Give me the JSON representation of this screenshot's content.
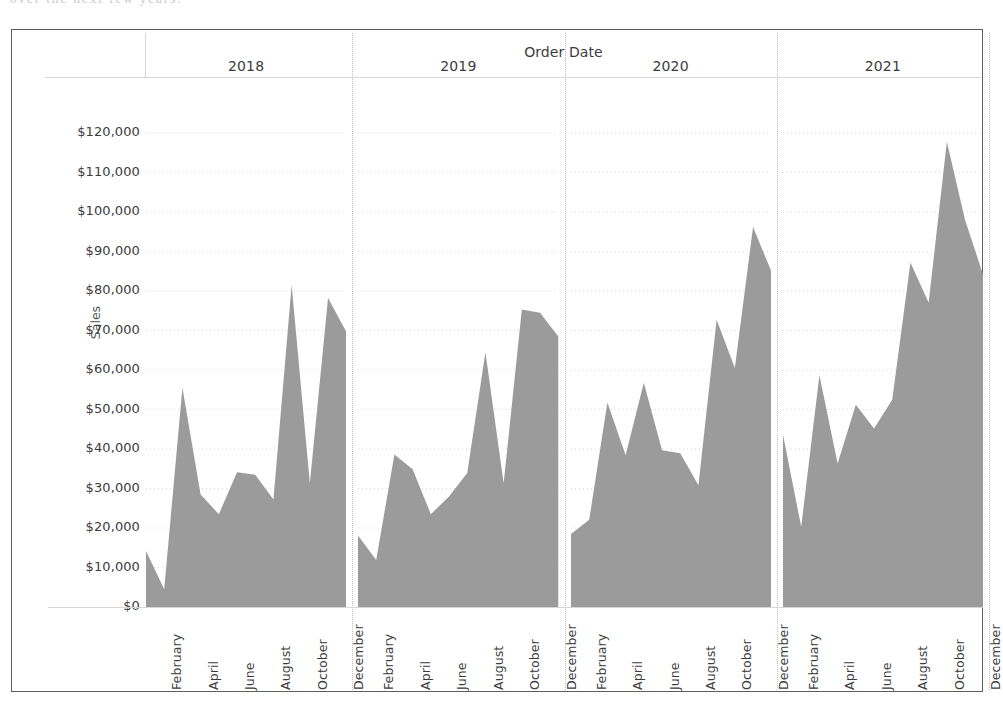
{
  "figure": {
    "title": "Order Date",
    "y_axis_title": "Sales",
    "area_color": "#9b9b9b",
    "grid_color": "#d6d6d6",
    "divider_color": "#bdbdbd",
    "frame_color": "#5d5d5d"
  },
  "scan_artifact_text": "over the next few years.",
  "y_ticks": [
    "$120,000",
    "$110,000",
    "$100,000",
    "$90,000",
    "$80,000",
    "$70,000",
    "$60,000",
    "$50,000",
    "$40,000",
    "$30,000",
    "$20,000",
    "$10,000",
    "$0"
  ],
  "panels": [
    {
      "year": "2018"
    },
    {
      "year": "2019"
    },
    {
      "year": "2020"
    },
    {
      "year": "2021"
    }
  ],
  "month_labels": [
    "February",
    "April",
    "June",
    "August",
    "October",
    "December"
  ],
  "chart_data": {
    "type": "area",
    "title": "Order Date",
    "xlabel": "Order Date",
    "ylabel": "Sales",
    "ylim": [
      0,
      120000
    ],
    "ytick_step": 10000,
    "grid": true,
    "legend": false,
    "panel_field": "Year of Order Date",
    "x_field": "Month of Order Date",
    "value_field": "Sales",
    "value_prefix": "$",
    "visible_x_tick_labels": [
      "February",
      "April",
      "June",
      "August",
      "October",
      "December"
    ],
    "months": [
      "January",
      "February",
      "March",
      "April",
      "May",
      "June",
      "July",
      "August",
      "September",
      "October",
      "November",
      "December"
    ],
    "series": [
      {
        "name": "2018",
        "values": [
          14200,
          4500,
          55500,
          28500,
          23500,
          34100,
          33500,
          27200,
          81500,
          31300,
          78200,
          69700
        ]
      },
      {
        "name": "2019",
        "values": [
          18100,
          11900,
          38600,
          34900,
          23500,
          28000,
          33900,
          64500,
          31300,
          75300,
          74500,
          68500
        ]
      },
      {
        "name": "2020",
        "values": [
          18500,
          22100,
          51800,
          38400,
          56800,
          39700,
          38900,
          30800,
          72700,
          60500,
          96200,
          85000
        ]
      },
      {
        "name": "2021",
        "values": [
          43600,
          20300,
          58700,
          36300,
          51200,
          45200,
          52500,
          87200,
          77000,
          117800,
          98000,
          84000
        ]
      }
    ]
  }
}
